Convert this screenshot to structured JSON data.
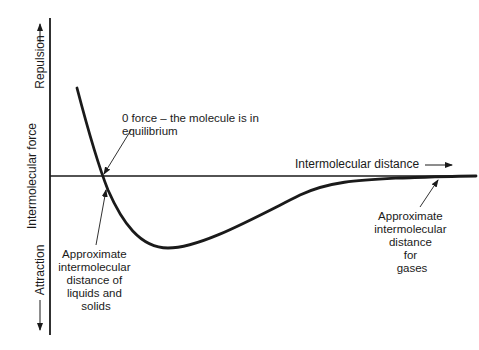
{
  "diagram": {
    "type": "intermolecular-force-curve",
    "y_axis": {
      "label": "Intermolecular force",
      "positive_label": "Repulsion",
      "negative_label": "Attraction"
    },
    "x_axis": {
      "label": "Intermolecular distance"
    },
    "annotations": {
      "zero_force": [
        "0 force – the molecule is in",
        "equilibrium"
      ],
      "liquids_solids": [
        "Approximate",
        "intermolecular",
        "distance of",
        "liquids and",
        "solids"
      ],
      "gases": [
        "Approximate",
        "intermolecular",
        "distance",
        "for",
        "gases"
      ]
    },
    "colors": {
      "ink": "#1a1a1a",
      "background": "#ffffff"
    }
  }
}
